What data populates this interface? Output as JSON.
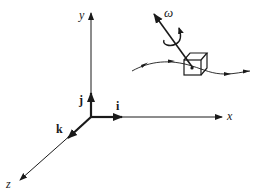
{
  "diagram": {
    "type": "coordinate-axes-with-rotating-body",
    "axes": {
      "x": {
        "label": "x"
      },
      "y": {
        "label": "y"
      },
      "z": {
        "label": "z"
      }
    },
    "unit_vectors": {
      "i": {
        "label": "i"
      },
      "j": {
        "label": "j"
      },
      "k": {
        "label": "k"
      }
    },
    "body": {
      "shape": "cube",
      "angular_velocity_label": "ω"
    },
    "trajectory": {
      "description": "curved path with arrows through cube"
    },
    "colors": {
      "ink": "#1a1a1a",
      "background": "#ffffff"
    }
  }
}
